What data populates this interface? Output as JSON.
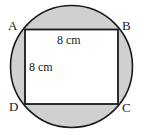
{
  "figure": {
    "colors": {
      "stroke": "#1a1a1a",
      "circle_fill": "#d0d0d0",
      "square_fill": "#ffffff",
      "background": "#ffffff",
      "text": "#1a1a1a"
    },
    "circle": {
      "center_x": 71.5,
      "center_y": 66.5,
      "radius": 61.5
    },
    "square": {
      "left": 25,
      "top": 29.5,
      "right": 118,
      "bottom": 104
    },
    "vertices": [
      {
        "id": "A",
        "label": "A",
        "position": "top-left"
      },
      {
        "id": "B",
        "label": "B",
        "position": "top-right"
      },
      {
        "id": "C",
        "label": "C",
        "position": "bottom-right"
      },
      {
        "id": "D",
        "label": "D",
        "position": "bottom-left"
      }
    ],
    "measurements": [
      {
        "id": "top-side",
        "label": "8 cm",
        "side": "AB",
        "value": 8,
        "unit": "cm"
      },
      {
        "id": "left-side",
        "label": "8 cm",
        "side": "AD",
        "value": 8,
        "unit": "cm"
      }
    ]
  }
}
